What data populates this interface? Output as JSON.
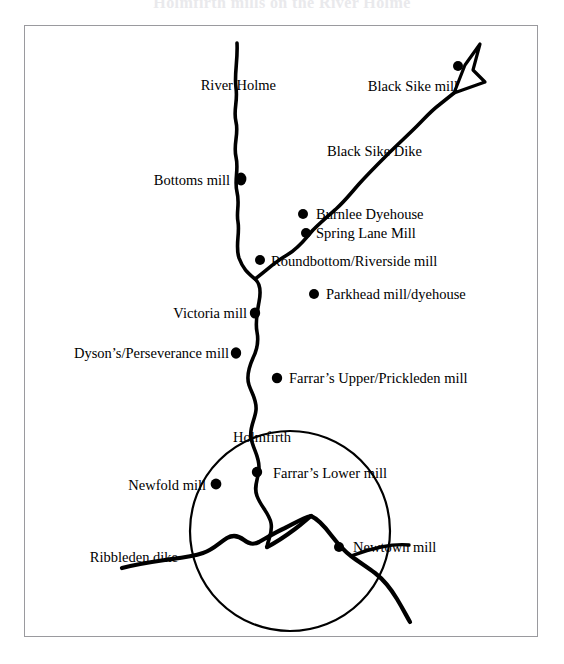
{
  "document": {
    "clipped_title_fragment": "Holmfirth mills on the River Holme",
    "figure_frame": "bordered map panel"
  },
  "map": {
    "title_label": "River Holme",
    "watercourses": [
      {
        "name": "River Holme",
        "label": "River Holme"
      },
      {
        "name": "Black Sike Dike",
        "label": "Black Sike Dike"
      },
      {
        "name": "Ribbleden dike",
        "label": "Ribbleden dike"
      }
    ],
    "settlement": {
      "name": "Holmfirth",
      "label": "Holmfirth"
    },
    "north_arrow": "north-arrow",
    "sites": [
      {
        "id": "black-sike-mill",
        "label": "Black Sike mill",
        "align": "right",
        "lx": 437,
        "ly": 67,
        "dx": 457,
        "dy": 65
      },
      {
        "id": "bottoms-mill",
        "label": "Bottoms mill",
        "align": "right",
        "lx": 228,
        "ly": 182,
        "dx": 240,
        "dy": 178
      },
      {
        "id": "burnlee-dyehouse",
        "label": "Burnlee Dyehouse",
        "align": "left",
        "lx": 315,
        "ly": 217,
        "dx": 302,
        "dy": 213
      },
      {
        "id": "spring-lane-mill",
        "label": "Spring Lane Mill",
        "align": "left",
        "lx": 315,
        "ly": 239,
        "dx": 305,
        "dy": 232
      },
      {
        "id": "roundbottom-riverside-mill",
        "label": "Roundbottom/Riverside mill",
        "align": "left",
        "lx": 270,
        "ly": 265,
        "dx": 259,
        "dy": 259
      },
      {
        "id": "parkhead-mill-dyehouse",
        "label": "Parkhead mill/dyehouse",
        "align": "left",
        "lx": 325,
        "ly": 296,
        "dx": 313,
        "dy": 293
      },
      {
        "id": "victoria-mill",
        "label": "Victoria mill",
        "align": "right",
        "lx": 245,
        "ly": 316,
        "dx": 254,
        "dy": 312
      },
      {
        "id": "dysons-perseverance-mill",
        "label": "Dyson’s/Perseverance mill",
        "align": "right",
        "lx": 228,
        "ly": 355,
        "dx": 235,
        "dy": 352
      },
      {
        "id": "farrars-upper-prickleden",
        "label": "Farrar’s Upper/Prickleden mill",
        "align": "left",
        "lx": 288,
        "ly": 380,
        "dx": 276,
        "dy": 377
      },
      {
        "id": "newfold-mill",
        "label": "Newfold mill",
        "align": "right",
        "lx": 205,
        "ly": 485,
        "dx": 215,
        "dy": 483
      },
      {
        "id": "farrars-lower-mill",
        "label": "Farrar’s Lower mill",
        "align": "left",
        "lx": 272,
        "ly": 475,
        "dx": 256,
        "dy": 471
      },
      {
        "id": "newtown-mill",
        "label": "Newtown mill",
        "align": "left",
        "lx": 352,
        "ly": 548,
        "dx": 338,
        "dy": 546
      }
    ],
    "place_labels": [
      {
        "id": "river-holme-label",
        "label": "River Holme",
        "align": "right",
        "lx": 275,
        "ly": 66
      },
      {
        "id": "black-sike-dike-label",
        "label": "Black Sike Dike",
        "align": "left",
        "lx": 326,
        "ly": 150
      },
      {
        "id": "holmfirth-label",
        "label": "Holmfirth",
        "align": "left",
        "lx": 232,
        "ly": 438
      },
      {
        "id": "ribbleden-dike-label",
        "label": "Ribbleden dike",
        "align": "right",
        "lx": 177,
        "ly": 558
      }
    ],
    "colors": {
      "ink": "#000000",
      "paper": "#ffffff",
      "frame": "#9a9a9e"
    }
  }
}
